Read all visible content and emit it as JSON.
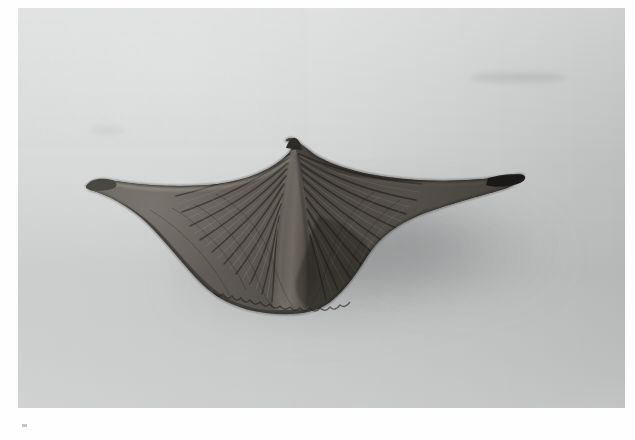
{
  "document": {
    "type": "photographic-plate",
    "medium": "black-and-white photograph",
    "title": "Brachiopod fossil specimen",
    "orientation": "dorsal view",
    "background_description": "plain light grey studio backdrop",
    "margin_color": "#ffffff"
  },
  "photo": {
    "frame": {
      "x": 18,
      "y": 8,
      "width": 607,
      "height": 400
    },
    "palette": {
      "backdrop_light": "#dcdddd",
      "backdrop_mid": "#cbcccc",
      "backdrop_dark": "#bdbebe",
      "shadow": "#8e9091",
      "specimen_light": "#9a9792",
      "specimen_mid": "#66625c",
      "specimen_dark": "#302e2b",
      "specimen_darkest": "#151413"
    },
    "lighting": {
      "key_direction": "upper-left",
      "cast_shadow_direction": "lower-right"
    }
  },
  "specimen": {
    "name": "winged brachiopod shell",
    "common_label": "spiriferid brachiopod",
    "features": [
      {
        "name": "beak-umbo",
        "description": "pointed apex at top centre",
        "x": 287,
        "y": 142
      },
      {
        "name": "median-fold",
        "description": "raised central fold running from beak to ventral margin"
      },
      {
        "name": "left-wing",
        "description": "triangular lateral extension tapering to a point",
        "tip_x": 86,
        "tip_y": 186
      },
      {
        "name": "right-wing",
        "description": "long narrow lateral spine tapering to a sharp point",
        "tip_x": 521,
        "tip_y": 177
      },
      {
        "name": "hinge-line",
        "description": "straight cardinal margin spanning both wings"
      },
      {
        "name": "radial-ribbing",
        "description": "fine radiating costae crossed by concentric growth lines"
      },
      {
        "name": "ventral-margin",
        "description": "crenulated rounded lower edge",
        "y": 310
      }
    ],
    "bounding_box": {
      "left": 86,
      "top": 140,
      "right": 521,
      "bottom": 312
    }
  },
  "marks": {
    "faint_smudges": [
      {
        "name": "upper-right-smudge",
        "x": 470,
        "y": 78,
        "width": 90,
        "height": 12
      },
      {
        "name": "upper-left-smudge",
        "x": 95,
        "y": 133,
        "width": 30,
        "height": 8
      }
    ],
    "registration_tick": {
      "name": "bottom-left-tick",
      "x": 22,
      "y": 424
    }
  }
}
